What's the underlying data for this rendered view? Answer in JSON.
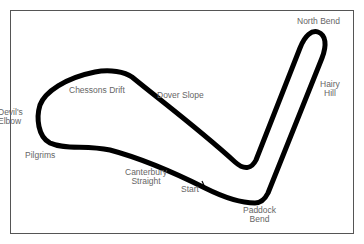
{
  "map": {
    "colors": {
      "track": "#000000",
      "frame": "#555555",
      "label": "#666666",
      "background": "#ffffff"
    },
    "labels": {
      "north_bend": "North Bend",
      "hairy_hill_1": "Hairy",
      "hairy_hill_2": "Hill",
      "chessons_drift": "Chessons Drift",
      "dover_slope": "Dover Slope",
      "devils_elbow_1": "Devil's",
      "devils_elbow_2": "Elbow",
      "pilgrims": "Pilgrims",
      "canterbury_straight_1": "Canterbury",
      "canterbury_straight_2": "Straight",
      "start": "Start",
      "paddock_bend_1": "Paddock",
      "paddock_bend_2": "Bend"
    }
  }
}
